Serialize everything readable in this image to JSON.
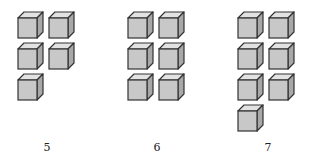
{
  "groups": [
    {
      "label": "5",
      "count": 5,
      "origin_x": 17,
      "label_x": 37
    },
    {
      "label": "6",
      "count": 6,
      "origin_x": 127,
      "label_x": 147
    },
    {
      "label": "7",
      "count": 7,
      "origin_x": 237,
      "label_x": 258
    }
  ],
  "layout": {
    "columns": 2,
    "col_spacing": 31,
    "row_spacing": 31,
    "top": 11
  },
  "colors": {
    "front": "#c8c8c8",
    "top": "#e2e2e2",
    "side": "#a8a8a8",
    "stroke": "#333333"
  }
}
